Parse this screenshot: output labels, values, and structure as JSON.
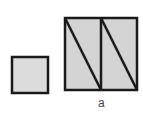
{
  "figure": {
    "label": "a",
    "colors": {
      "fill": "#dcdcdc",
      "stroke": "#1a1a1a"
    },
    "small_square": {
      "x": 12,
      "y": 57,
      "size": 36
    },
    "large_square": {
      "x": 65,
      "y": 18,
      "size": 72,
      "divider_x": 101
    }
  }
}
